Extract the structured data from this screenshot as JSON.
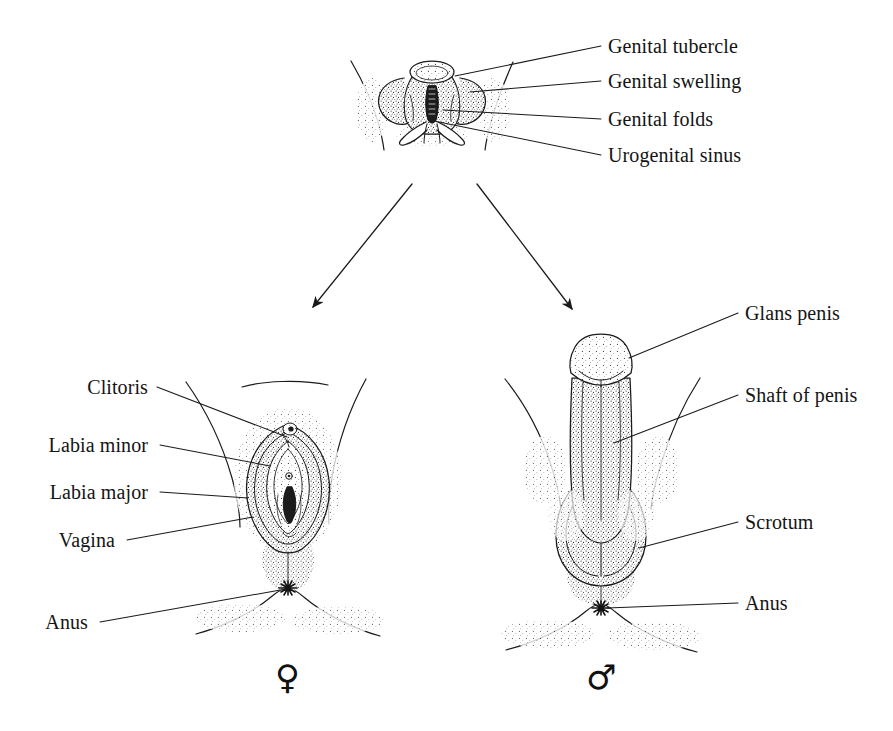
{
  "figure": {
    "background_color": "#ffffff",
    "ink_color": "#141414"
  },
  "indifferent_stage": {
    "labels": [
      {
        "id": "genital-tubercle",
        "text": "Genital tubercle"
      },
      {
        "id": "genital-swelling",
        "text": "Genital swelling"
      },
      {
        "id": "genital-folds",
        "text": "Genital folds"
      },
      {
        "id": "urogenital-sinus",
        "text": "Urogenital sinus"
      }
    ]
  },
  "female_stage": {
    "symbol": "♀",
    "symbol_name": "female-symbol",
    "labels": [
      {
        "id": "clitoris",
        "text": "Clitoris"
      },
      {
        "id": "labia-minor",
        "text": "Labia minor"
      },
      {
        "id": "labia-major",
        "text": "Labia major"
      },
      {
        "id": "vagina",
        "text": "Vagina"
      },
      {
        "id": "anus",
        "text": "Anus"
      }
    ]
  },
  "male_stage": {
    "symbol": "♂",
    "symbol_name": "male-symbol",
    "labels": [
      {
        "id": "glans-penis",
        "text": "Glans penis"
      },
      {
        "id": "shaft-of-penis",
        "text": "Shaft of penis"
      },
      {
        "id": "scrotum",
        "text": "Scrotum"
      },
      {
        "id": "anus",
        "text": "Anus"
      }
    ]
  }
}
